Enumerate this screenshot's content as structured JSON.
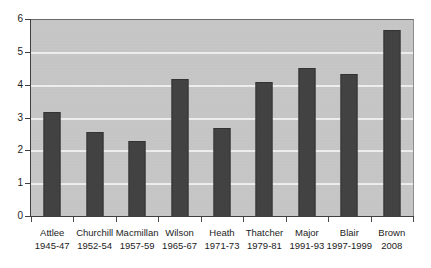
{
  "chart_data": {
    "type": "bar",
    "title": "",
    "subtitle": "",
    "xlabel": "",
    "ylabel": "",
    "ylim": [
      0,
      6
    ],
    "ytick_step": 1,
    "yticks": [
      "0",
      "1",
      "2",
      "3",
      "4",
      "5",
      "6"
    ],
    "grid": true,
    "legend": "none",
    "categories": [
      "Attlee",
      "Churchill",
      "Macmillan",
      "Wilson",
      "Heath",
      "Thatcher",
      "Major",
      "Blair",
      "Brown"
    ],
    "category_sublabels": [
      "1945-47",
      "1952-54",
      "1957-59",
      "1965-67",
      "1971-73",
      "1979-81",
      "1991-93",
      "1997-1999",
      "2008"
    ],
    "values": [
      3.2,
      2.6,
      2.3,
      4.2,
      2.7,
      4.1,
      4.55,
      4.35,
      5.7
    ],
    "colors": {
      "bar": "#3c3c3c",
      "bar_border": "#2c2c2c",
      "plot_background": "#c9c9c9",
      "gridline": "#f3f3f3",
      "axis": "#3f3f3f",
      "text": "#1c1c1c",
      "page_background": "#ffffff"
    }
  }
}
